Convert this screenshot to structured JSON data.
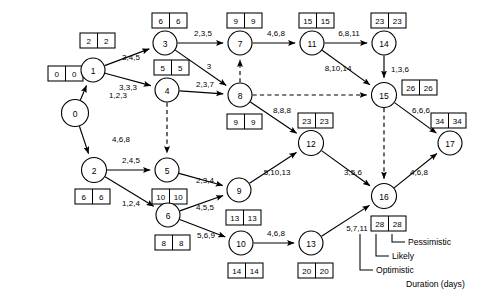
{
  "diagram": {
    "type": "network-diagram",
    "stroke_color": "#000000",
    "background_color": "#ffffff"
  },
  "nodes": [
    {
      "id": "0",
      "label": "0",
      "cx": 75,
      "cy": 113,
      "r": 13.5,
      "early": "0",
      "late": "0",
      "box_x": 48,
      "box_y": 66
    },
    {
      "id": "1",
      "label": "1",
      "cx": 93,
      "cy": 70,
      "r": 12.0,
      "early": "2",
      "late": "2",
      "box_x": 80,
      "box_y": 33
    },
    {
      "id": "2",
      "label": "2",
      "cx": 94,
      "cy": 170,
      "r": 12.5,
      "early": "6",
      "late": "6",
      "box_x": 75,
      "box_y": 189
    },
    {
      "id": "3",
      "label": "3",
      "cx": 165,
      "cy": 43,
      "r": 12.0,
      "early": "6",
      "late": "6",
      "box_x": 152,
      "box_y": 13
    },
    {
      "id": "4",
      "label": "4",
      "cx": 167,
      "cy": 90,
      "r": 12.0,
      "early": "5",
      "late": "5",
      "box_x": 154,
      "box_y": 60
    },
    {
      "id": "5",
      "label": "5",
      "cx": 167,
      "cy": 170,
      "r": 12.0,
      "early": "10",
      "late": "10",
      "box_x": 152,
      "box_y": 189
    },
    {
      "id": "6",
      "label": "6",
      "cx": 168,
      "cy": 215,
      "r": 12.0,
      "early": "8",
      "late": "8",
      "box_x": 155,
      "box_y": 235
    },
    {
      "id": "7",
      "label": "7",
      "cx": 240,
      "cy": 43,
      "r": 12.0,
      "early": "9",
      "late": "9",
      "box_x": 227,
      "box_y": 13
    },
    {
      "id": "8",
      "label": "8",
      "cx": 240,
      "cy": 95,
      "r": 12.0,
      "early": "9",
      "late": "9",
      "box_x": 227,
      "box_y": 114
    },
    {
      "id": "9",
      "label": "9",
      "cx": 239,
      "cy": 190,
      "r": 12.0,
      "early": "13",
      "late": "13",
      "box_x": 226,
      "box_y": 210
    },
    {
      "id": "10",
      "label": "10",
      "cx": 241,
      "cy": 243,
      "r": 12.0,
      "early": "14",
      "late": "14",
      "box_x": 228,
      "box_y": 263
    },
    {
      "id": "11",
      "label": "11",
      "cx": 312,
      "cy": 43,
      "r": 12.0,
      "early": "15",
      "late": "15",
      "box_x": 299,
      "box_y": 13
    },
    {
      "id": "12",
      "label": "12",
      "cx": 311,
      "cy": 143,
      "r": 12.5,
      "early": "23",
      "late": "23",
      "box_x": 298,
      "box_y": 113
    },
    {
      "id": "13",
      "label": "13",
      "cx": 311,
      "cy": 243,
      "r": 12.0,
      "early": "20",
      "late": "20",
      "box_x": 298,
      "box_y": 263
    },
    {
      "id": "14",
      "label": "14",
      "cx": 384,
      "cy": 43,
      "r": 12.0,
      "early": "23",
      "late": "23",
      "box_x": 371,
      "box_y": 13
    },
    {
      "id": "15",
      "label": "15",
      "cx": 384,
      "cy": 95,
      "r": 12.5,
      "early": "26",
      "late": "26",
      "box_x": 402,
      "box_y": 80
    },
    {
      "id": "16",
      "label": "16",
      "cx": 384,
      "cy": 196,
      "r": 12.5,
      "early": "28",
      "late": "28",
      "box_x": 371,
      "box_y": 216
    },
    {
      "id": "17",
      "label": "17",
      "cx": 450,
      "cy": 143,
      "r": 12.0,
      "early": "34",
      "late": "34",
      "box_x": 431,
      "box_y": 113
    }
  ],
  "edges": [
    {
      "from": "0",
      "to": "1",
      "label": "1,2,3",
      "dummy": false,
      "lx": 118,
      "ly": 95
    },
    {
      "from": "0",
      "to": "2",
      "label": "4,6,8",
      "dummy": false,
      "lx": 121,
      "ly": 139
    },
    {
      "from": "1",
      "to": "3",
      "label": "3,4,5",
      "dummy": false,
      "lx": 131,
      "ly": 57
    },
    {
      "from": "1",
      "to": "4",
      "label": "3,3,3",
      "dummy": false,
      "lx": 128,
      "ly": 87
    },
    {
      "from": "3",
      "to": "7",
      "label": "2,3,5",
      "dummy": false,
      "lx": 203,
      "ly": 33
    },
    {
      "from": "3",
      "to": "8",
      "label": "3",
      "dummy": false,
      "lx": 209,
      "ly": 66
    },
    {
      "from": "4",
      "to": "8",
      "label": "2,3,7",
      "dummy": false,
      "lx": 205,
      "ly": 84
    },
    {
      "from": "4",
      "to": "5",
      "label": "",
      "dummy": true,
      "lx": 0,
      "ly": 0
    },
    {
      "from": "8",
      "to": "7",
      "label": "",
      "dummy": true,
      "lx": 0,
      "ly": 0
    },
    {
      "from": "8",
      "to": "15",
      "label": "",
      "dummy": true,
      "lx": 0,
      "ly": 0
    },
    {
      "from": "8",
      "to": "12",
      "label": "8,8,8",
      "dummy": false,
      "lx": 282,
      "ly": 110
    },
    {
      "from": "7",
      "to": "11",
      "label": "4,6,8",
      "dummy": false,
      "lx": 276,
      "ly": 33
    },
    {
      "from": "11",
      "to": "14",
      "label": "6,8,11",
      "dummy": false,
      "lx": 349,
      "ly": 33
    },
    {
      "from": "11",
      "to": "15",
      "label": "8,10,14",
      "dummy": false,
      "lx": 338,
      "ly": 68
    },
    {
      "from": "14",
      "to": "15",
      "label": "1,3,6",
      "dummy": false,
      "lx": 400,
      "ly": 69
    },
    {
      "from": "15",
      "to": "16",
      "label": "",
      "dummy": true,
      "lx": 0,
      "ly": 0
    },
    {
      "from": "15",
      "to": "17",
      "label": "6,6,6",
      "dummy": false,
      "lx": 421,
      "ly": 110
    },
    {
      "from": "2",
      "to": "5",
      "label": "2,4,5",
      "dummy": false,
      "lx": 131,
      "ly": 160
    },
    {
      "from": "2",
      "to": "6",
      "label": "1,2,4",
      "dummy": false,
      "lx": 131,
      "ly": 203
    },
    {
      "from": "5",
      "to": "9",
      "label": "2,3,4",
      "dummy": false,
      "lx": 205,
      "ly": 180
    },
    {
      "from": "6",
      "to": "9",
      "label": "4,5,5",
      "dummy": false,
      "lx": 205,
      "ly": 207
    },
    {
      "from": "6",
      "to": "10",
      "label": "5,6,9",
      "dummy": false,
      "lx": 206,
      "ly": 235
    },
    {
      "from": "9",
      "to": "12",
      "label": "5,10,13",
      "dummy": false,
      "lx": 277,
      "ly": 172
    },
    {
      "from": "10",
      "to": "13",
      "label": "4,6,8",
      "dummy": false,
      "lx": 276,
      "ly": 233
    },
    {
      "from": "12",
      "to": "16",
      "label": "3,5,6",
      "dummy": false,
      "lx": 353,
      "ly": 172
    },
    {
      "from": "13",
      "to": "16",
      "label": "5,7,11",
      "dummy": false,
      "lx": 357,
      "ly": 228
    },
    {
      "from": "16",
      "to": "17",
      "label": "4,6,8",
      "dummy": false,
      "lx": 419,
      "ly": 172
    }
  ],
  "legend": {
    "sample": "5,7,11",
    "items": [
      {
        "label": "Pessimistic"
      },
      {
        "label": "Likely"
      },
      {
        "label": "Optimistic"
      }
    ],
    "units": "Duration (days)"
  }
}
